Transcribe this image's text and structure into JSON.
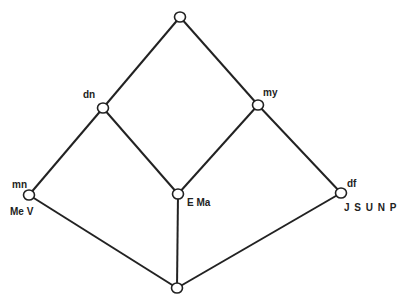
{
  "diagram": {
    "type": "lattice",
    "nodes": [
      {
        "id": "top",
        "x": 180,
        "y": 17,
        "upper_label": "",
        "lower_label": ""
      },
      {
        "id": "dn",
        "x": 103,
        "y": 108,
        "upper_label": "dn",
        "lower_label": ""
      },
      {
        "id": "my",
        "x": 258,
        "y": 105,
        "upper_label": "my",
        "lower_label": ""
      },
      {
        "id": "mn",
        "x": 29,
        "y": 195,
        "upper_label": "mn",
        "lower_label": "Me V"
      },
      {
        "id": "ema",
        "x": 178,
        "y": 194,
        "upper_label": "",
        "lower_label": "E Ma"
      },
      {
        "id": "df",
        "x": 341,
        "y": 193,
        "upper_label": "df",
        "lower_label": "J S U N P"
      },
      {
        "id": "bottom",
        "x": 177,
        "y": 288,
        "upper_label": "",
        "lower_label": ""
      }
    ],
    "edges": [
      [
        "top",
        "dn"
      ],
      [
        "top",
        "my"
      ],
      [
        "dn",
        "mn"
      ],
      [
        "dn",
        "ema"
      ],
      [
        "my",
        "ema"
      ],
      [
        "my",
        "df"
      ],
      [
        "mn",
        "bottom"
      ],
      [
        "ema",
        "bottom"
      ],
      [
        "df",
        "bottom"
      ]
    ]
  },
  "labels": {
    "dn": "dn",
    "my": "my",
    "mn": "mn",
    "me_v": "Me V",
    "e_ma": "E Ma",
    "df": "df",
    "jsunp": "J S U N P"
  }
}
